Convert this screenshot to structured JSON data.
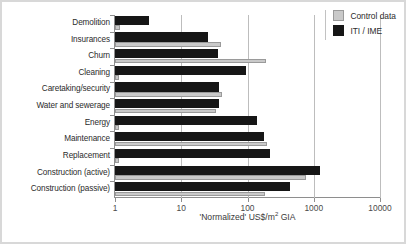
{
  "chart_data": {
    "type": "bar",
    "orientation": "horizontal",
    "title": "",
    "xlabel": "'Normalized' US$/m2 GIA",
    "ylabel": "",
    "xscale": "log",
    "xlim": [
      1,
      10000
    ],
    "xticks": [
      "1",
      "10",
      "100",
      "1000",
      "10000"
    ],
    "grid": true,
    "legend_position": "top-right",
    "categories": [
      "Demolition",
      "Insurances",
      "Churn",
      "Cleaning",
      "Caretaking/security",
      "Water and sewerage",
      "Energy",
      "Maintenance",
      "Replacement",
      "Construction (active)",
      "Construction (passive)"
    ],
    "series": [
      {
        "name": "ITI / IME",
        "color": "#161616",
        "values": [
          3.3,
          25,
          36,
          95,
          37,
          37,
          140,
          180,
          215,
          1250,
          440
        ]
      },
      {
        "name": "Control data",
        "color": "#c9c9c9",
        "values": [
          1.2,
          40,
          190,
          1.0,
          41,
          34,
          1.0,
          200,
          1.0,
          760,
          185
        ]
      }
    ]
  },
  "legend": {
    "items": [
      {
        "label": "Control data",
        "swatch": "control-swatch"
      },
      {
        "label": "ITI / IME",
        "swatch": "iti-swatch"
      }
    ]
  },
  "axis": {
    "x_title_prefix": "'Normalized' US$/m",
    "x_title_sup": "2",
    "x_title_suffix": " GIA"
  }
}
